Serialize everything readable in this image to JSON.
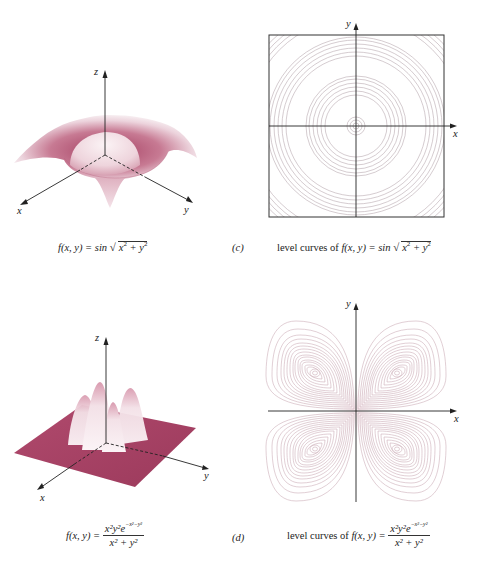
{
  "figure": {
    "panels": [
      {
        "id": "c-surface",
        "type": "3d-surface",
        "axes": {
          "x": "x",
          "y": "y",
          "z": "z"
        },
        "caption": {
          "lhs": "f(x, y) = sin",
          "radicand": "x",
          "radicand_rest": " + y",
          "exp": "2"
        }
      },
      {
        "id": "c-contour",
        "type": "contour",
        "axes": {
          "x": "x",
          "y": "y"
        },
        "label": "(c)",
        "caption": {
          "prefix": "level curves of ",
          "lhs": "f(x, y) = sin",
          "radicand": "x",
          "radicand_rest": " + y",
          "exp": "2"
        }
      },
      {
        "id": "d-surface",
        "type": "3d-surface",
        "axes": {
          "x": "x",
          "y": "y",
          "z": "z"
        },
        "caption": {
          "lhs": "f(x, y) =",
          "numerator": "x²y²e",
          "num_exp": "−x²−y²",
          "denominator": "x² + y²"
        }
      },
      {
        "id": "d-contour",
        "type": "contour",
        "axes": {
          "x": "x",
          "y": "y"
        },
        "label": "(d)",
        "caption": {
          "prefix": "level curves of ",
          "lhs": "f(x, y) =",
          "numerator": "x²y²e",
          "num_exp": "−x²−y²",
          "denominator": "x² + y²"
        }
      }
    ],
    "colors": {
      "surface": "#a84466",
      "surface_light": "#f4e6ea",
      "contour": "#c9a9b3",
      "axis": "#222222",
      "box": "#333333"
    }
  }
}
